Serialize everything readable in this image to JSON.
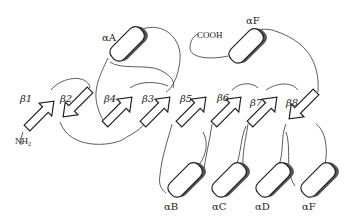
{
  "diagram": {
    "type": "protein-topology",
    "termini": {
      "n": "NH2",
      "c": "COOH"
    },
    "strands": [
      {
        "id": "b1",
        "greek": "β",
        "num": "1",
        "direction": "up",
        "x": 42,
        "y": 116
      },
      {
        "id": "b2",
        "greek": "β",
        "num": "2",
        "direction": "down",
        "x": 78,
        "y": 116
      },
      {
        "id": "b4",
        "greek": "β",
        "num": "4",
        "direction": "up",
        "x": 120,
        "y": 116
      },
      {
        "id": "b3",
        "greek": "β",
        "num": "3",
        "direction": "up",
        "x": 157,
        "y": 116
      },
      {
        "id": "b5",
        "greek": "β",
        "num": "5",
        "direction": "up",
        "x": 193,
        "y": 116
      },
      {
        "id": "b6",
        "greek": "β",
        "num": "6",
        "direction": "up",
        "x": 228,
        "y": 116
      },
      {
        "id": "b7",
        "greek": "β",
        "num": "7",
        "direction": "up",
        "x": 264,
        "y": 116
      },
      {
        "id": "b8",
        "greek": "β",
        "num": "8",
        "direction": "down",
        "x": 300,
        "y": 116
      }
    ],
    "helices": [
      {
        "id": "aA",
        "greek": "α",
        "letter": "A",
        "position": "top"
      },
      {
        "id": "aF_top",
        "greek": "α",
        "letter": "F",
        "position": "top"
      },
      {
        "id": "aB",
        "greek": "α",
        "letter": "B",
        "position": "bottom"
      },
      {
        "id": "aC",
        "greek": "α",
        "letter": "C",
        "position": "bottom"
      },
      {
        "id": "aD",
        "greek": "α",
        "letter": "D",
        "position": "bottom"
      },
      {
        "id": "aF_bottom",
        "greek": "α",
        "letter": "F",
        "position": "bottom"
      }
    ],
    "labels": {
      "b1": "β1",
      "b2": "β2",
      "b3": "β3",
      "b4": "β4",
      "b5": "β5",
      "b6": "β6",
      "b7": "β7",
      "b8": "β8",
      "aA": "αA",
      "aF_top": "αF",
      "aB": "αB",
      "aC": "αC",
      "aD": "αD",
      "aF_bottom": "αF",
      "nh2": "NH",
      "nh2_sub": "2",
      "cooh": "COOH"
    },
    "colors": {
      "line": "#222222",
      "fill": "#ffffff",
      "shadow": "#555555"
    }
  }
}
